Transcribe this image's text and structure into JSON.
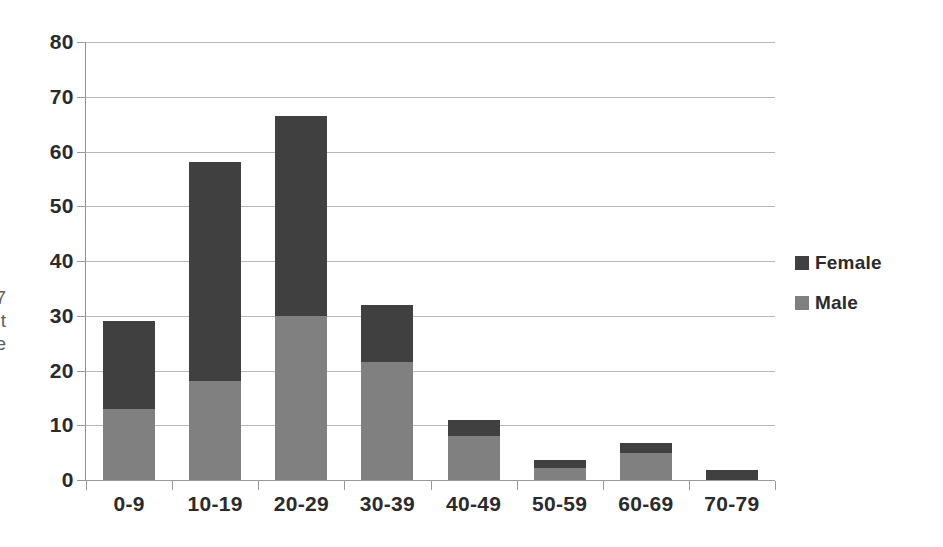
{
  "caption_fragment": {
    "lines": [
      "7",
      "t",
      "e"
    ]
  },
  "legend": {
    "position": "right",
    "items": [
      {
        "label": "Female",
        "color": "#404040",
        "swatch_name": "legend-swatch-female"
      },
      {
        "label": "Male",
        "color": "#808080",
        "swatch_name": "legend-swatch-male"
      }
    ]
  },
  "axes": {
    "y_ticks": [
      "80",
      "70",
      "60",
      "50",
      "40",
      "30",
      "20",
      "10",
      "0"
    ],
    "x_ticks": [
      "0-9",
      "10-19",
      "20-29",
      "30-39",
      "40-49",
      "50-59",
      "60-69",
      "70-79"
    ]
  },
  "colors": {
    "female": "#404040",
    "male": "#808080",
    "gridline": "#b8b8b8",
    "axis": "#8f8f8f",
    "text": "#2b2b2b",
    "background": "#ffffff"
  },
  "chart_data": {
    "type": "bar",
    "subtype": "stacked-vertical",
    "title": "",
    "subtitle": "",
    "xlabel": "",
    "ylabel": "",
    "ylim": [
      0,
      80
    ],
    "y_tick_step": 10,
    "grid": true,
    "legend_position": "right",
    "categories": [
      "0-9",
      "10-19",
      "20-29",
      "30-39",
      "40-49",
      "50-59",
      "60-69",
      "70-79"
    ],
    "series": [
      {
        "name": "Male",
        "color": "#808080",
        "stack_order": "bottom",
        "values": [
          13,
          18,
          30,
          21.5,
          8,
          2.2,
          5,
          0
        ]
      },
      {
        "name": "Female",
        "color": "#404040",
        "stack_order": "top",
        "values": [
          16,
          40,
          36.5,
          10.5,
          3,
          1.5,
          1.7,
          1.8
        ]
      }
    ],
    "totals": [
      29,
      58,
      66.5,
      32,
      11,
      3.7,
      6.7,
      1.8
    ]
  }
}
